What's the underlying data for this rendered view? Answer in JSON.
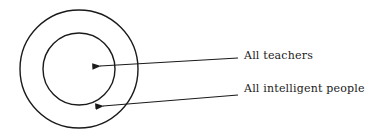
{
  "diagram": {
    "type": "euler-diagram",
    "stroke_color": "#1a1a1a",
    "background": "#ffffff",
    "sets": [
      {
        "id": "outer",
        "label": "All intelligent people",
        "cx": 79,
        "cy": 69,
        "r": 59
      },
      {
        "id": "inner",
        "label": "All teachers",
        "cx": 79,
        "cy": 69,
        "r": 36
      }
    ],
    "labels": {
      "inner": "All teachers",
      "outer": "All intelligent people"
    }
  }
}
